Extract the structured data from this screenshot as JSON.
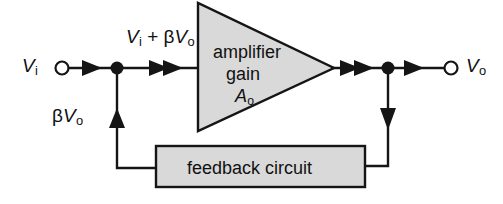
{
  "diagram": {
    "background_color": "#ffffff",
    "line_color": "#151515",
    "block_fill_color": "#d9d9d9",
    "labels": {
      "input_terminal": "V",
      "input_terminal_sub": "i",
      "output_terminal": "V",
      "output_terminal_sub": "o",
      "summing_expression_v": "V",
      "summing_expression_v_sub": "i",
      "summing_expression_plus": " + ",
      "summing_expression_beta": "β",
      "summing_expression_beta_v": "V",
      "summing_expression_beta_v_sub": "o",
      "feedback_signal_beta": "β",
      "feedback_signal_v": "V",
      "feedback_signal_v_sub": "o",
      "amplifier_line1": "amplifier",
      "amplifier_line2": "gain",
      "amplifier_gain_symbol": "A",
      "amplifier_gain_sub": "o",
      "feedback_block": "feedback circuit"
    },
    "blocks": [
      {
        "name": "amplifier",
        "shape": "triangle",
        "text": "amplifier gain A_o",
        "fill": "#d9d9d9"
      },
      {
        "name": "feedback-circuit",
        "shape": "rectangle",
        "text": "feedback circuit",
        "fill": "#d9d9d9"
      }
    ],
    "nodes": [
      {
        "name": "summing-node",
        "x": 117,
        "y": 68
      },
      {
        "name": "output-tap-node",
        "x": 388,
        "y": 68
      }
    ],
    "terminals": [
      {
        "name": "input-terminal",
        "x": 62,
        "y": 68,
        "label": "Vi"
      },
      {
        "name": "output-terminal",
        "x": 451,
        "y": 68,
        "label": "Vo"
      }
    ],
    "signal_flow": [
      "Vi enters at input terminal and flows right to summing node",
      "Summing node output Vi + betaVo flows into amplifier input",
      "Amplifier of gain Ao outputs Vo at apex",
      "Vo splits at output tap node to output terminal and down to feedback circuit",
      "Feedback circuit returns betaVo up into summing node"
    ]
  }
}
